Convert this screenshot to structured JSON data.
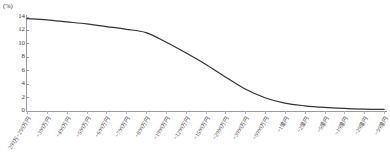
{
  "chart_data": {
    "type": "line",
    "title": "",
    "subtitle": "",
    "xlabel": "",
    "ylabel": "",
    "y_unit_label": "(%)",
    "grid": false,
    "legend": "none",
    "ylim": [
      0,
      14
    ],
    "y_ticks": [
      14,
      12,
      10,
      8,
      6,
      4,
      2,
      0
    ],
    "y_tick_labels": [
      "14",
      "12",
      "10",
      "8",
      "6",
      "4",
      "2",
      "0"
    ],
    "categories": [
      "200万~250万円",
      "~300万円",
      "~400万円",
      "~500万円",
      "~600万円",
      "~700万円",
      "~800万円",
      "~1000万円",
      "~1200万円",
      "~1500万円",
      "~2000万円",
      "~3000万円",
      "~5000万円",
      "~1億円",
      "~2億円",
      "~5億円",
      "~10億円",
      "~20億円",
      "~50億円"
    ],
    "series": [
      {
        "name": "",
        "color": "#333333",
        "values": [
          13.7,
          13.5,
          13.2,
          12.9,
          12.5,
          12.1,
          11.6,
          10.2,
          8.6,
          6.9,
          5.0,
          3.2,
          1.9,
          1.1,
          0.7,
          0.45,
          0.3,
          0.2,
          0.15
        ]
      }
    ]
  }
}
